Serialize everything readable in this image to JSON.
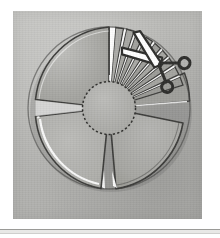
{
  "page": {
    "background_color": "#ffffff",
    "width": 220,
    "height": 238
  },
  "figure": {
    "name": "sliced-wheel-with-scissors",
    "panel_color": "#b9b9b6",
    "ink_color": "#3a3a38",
    "highlight_color": "#ffffff",
    "caption": ""
  },
  "wheel": {
    "center_x": 96,
    "center_y": 97,
    "outer_radius": 82,
    "hub_radius": 26,
    "hub_outline_style": "dashed",
    "hub_fill": "#b0b0ad",
    "quadrant_count": 4,
    "thin_slice_count": 9,
    "gap_degrees": 7
  },
  "quadrants": [
    {
      "name": "upper-left-wedge",
      "start_deg": 186,
      "end_deg": 264,
      "fill": "#a8a8a4",
      "label": ""
    },
    {
      "name": "lower-left-wedge",
      "start_deg": 96,
      "end_deg": 174,
      "fill": "#b2b2ae",
      "label": ""
    },
    {
      "name": "lower-right-wedge",
      "start_deg": 6,
      "end_deg": 84,
      "fill": "#ababa7",
      "label": ""
    },
    {
      "name": "right-wedge",
      "start_deg": 336,
      "end_deg": 354,
      "fill": "#9d9d99",
      "label": ""
    }
  ],
  "thin_slices": [
    {
      "name": "slice-1",
      "start_deg": 274,
      "end_deg": 283,
      "fill": "#a9a9a5"
    },
    {
      "name": "slice-2",
      "start_deg": 285,
      "end_deg": 294,
      "fill": "#a5a5a1"
    },
    {
      "name": "slice-3",
      "start_deg": 296,
      "end_deg": 305,
      "fill": "#a9a9a5"
    },
    {
      "name": "slice-4",
      "start_deg": 307,
      "end_deg": 316,
      "fill": "#a3a39f"
    },
    {
      "name": "slice-5",
      "start_deg": 318,
      "end_deg": 327,
      "fill": "#a7a7a3"
    },
    {
      "name": "slice-6",
      "start_deg": 329,
      "end_deg": 336,
      "fill": "#9f9f9b"
    },
    {
      "name": "slice-7",
      "start_deg": 338,
      "end_deg": 345,
      "fill": "#a4a4a0"
    },
    {
      "name": "slice-8",
      "start_deg": 347,
      "end_deg": 353,
      "fill": "#9d9d99"
    },
    {
      "name": "slice-9",
      "start_deg": 355,
      "end_deg": 360,
      "fill": "#a1a19d"
    }
  ],
  "scissors": {
    "name": "scissors-icon",
    "position_x": 152,
    "position_y": 44,
    "rotation_deg": 38,
    "color": "#2e2e2c",
    "label": "scissors"
  },
  "rule": {
    "name": "bottom-divider",
    "color_top": "#9a9a97",
    "color_fill": "#e8e8e6",
    "color_bottom": "#cfcfcd"
  }
}
